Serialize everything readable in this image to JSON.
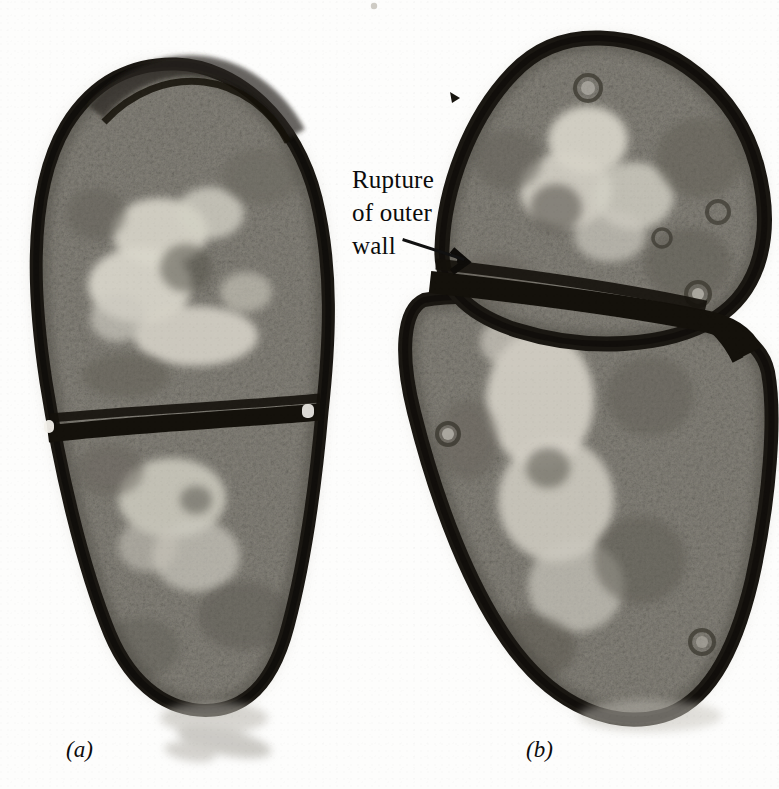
{
  "figure": {
    "kind": "electron-micrograph",
    "background_color": "#fdfdfc",
    "ink_color": "#0b0b0b",
    "width": 779,
    "height": 789
  },
  "annotations": {
    "rupture": {
      "line1": "Rupture",
      "line2": "of outer",
      "line3": "wall",
      "leader_line": {
        "x1": 404,
        "y1": 240,
        "x2": 463,
        "y2": 259,
        "color": "#111111",
        "width": 3
      }
    }
  },
  "panels": [
    {
      "id": "a",
      "label": "(a)",
      "x": 66,
      "y": 737
    },
    {
      "id": "b",
      "label": "(b)",
      "x": 526,
      "y": 737
    }
  ],
  "specimens": {
    "panel_a": {
      "description": "dividing bacterial cell, two daughter compartments separated by a transverse septum",
      "wall_color": "#17140f",
      "cytoplasm_color": "#8c8980",
      "nucleoid_color": "#d6d3c8",
      "septum_y": 424
    },
    "panel_b": {
      "description": "dividing bacterial cell, rounded upper compartment and elongated lower compartment separated by a thick oblique septum; outer wall ruptured at left of septum",
      "wall_color": "#17140f",
      "cytoplasm_color": "#8c8980",
      "nucleoid_color": "#d6d3c8",
      "septum_angle_deg": 11
    }
  }
}
